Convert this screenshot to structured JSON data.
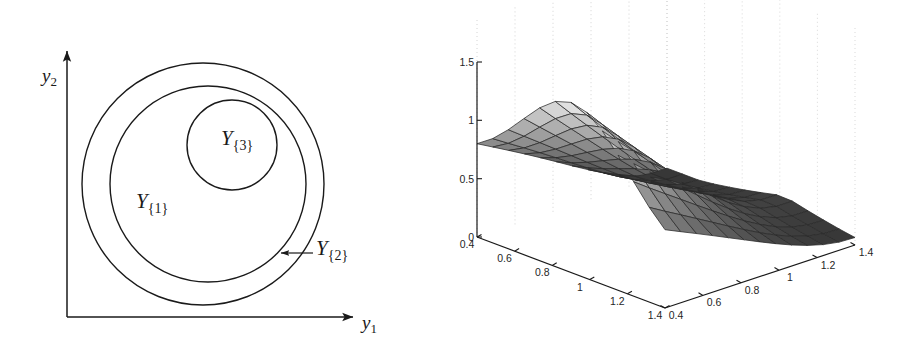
{
  "figure": {
    "panels": [
      {
        "id": "set-diagram",
        "kind": "diagram",
        "axes": {
          "x_label": "y",
          "x_label_sub": "1",
          "y_label": "y",
          "y_label_sub": "2",
          "origin_px": [
            67,
            317
          ],
          "x_axis_end_px": [
            357,
            317
          ],
          "y_axis_end_px": [
            67,
            47
          ],
          "arrow_heads": true
        },
        "regions": [
          {
            "name": "Y1",
            "label": "Y",
            "label_sub": "{1}",
            "shape": "circle",
            "center_px": [
              208,
              184
            ],
            "radius_px": 98,
            "label_px": [
              143,
              202
            ],
            "fill": "none",
            "stroke": "#1a1a1a"
          },
          {
            "name": "Y2",
            "label": "Y",
            "label_sub": "{2}",
            "shape": "circle",
            "center_px": [
              203,
              184
            ],
            "radius_px": 121,
            "label_px": [
              318,
              248
            ],
            "fill": "none",
            "stroke": "#1a1a1a",
            "leader_arrow": {
              "from_px": [
                312,
                253
              ],
              "to_px": [
                282,
                253
              ]
            }
          },
          {
            "name": "Y3",
            "label": "Y",
            "label_sub": "{3}",
            "shape": "circle",
            "center_px": [
              232,
              145
            ],
            "radius_px": 45,
            "label_px": [
              228,
              140
            ],
            "fill": "none",
            "stroke": "#1a1a1a"
          }
        ]
      },
      {
        "id": "surface-plot",
        "kind": "surface3d"
      }
    ]
  },
  "chart_data": {
    "type": "surface",
    "title": "",
    "xlabel": "",
    "ylabel": "",
    "zlabel": "",
    "grid": true,
    "grid_style": "dotted-vertical",
    "legend": "none",
    "colormap": "gray",
    "view": {
      "projection": "axonometric",
      "front_corner_px": [
        665,
        308
      ],
      "left_corner_px": [
        477,
        237
      ],
      "right_corner_px": [
        855,
        245
      ],
      "z_top_px": [
        477,
        62
      ]
    },
    "axes": {
      "x": {
        "label": "",
        "ticks": [
          0.4,
          0.6,
          0.8,
          1,
          1.2,
          1.4
        ],
        "tick_labels": [
          "0.4",
          "0.6",
          "0.8",
          "1",
          "1.2",
          "1.4"
        ],
        "lim": [
          0.4,
          1.4
        ],
        "direction": "left-back-to-front",
        "note": "runs from upper-left corner down-right to front corner"
      },
      "y": {
        "label": "",
        "ticks": [
          0.4,
          0.6,
          0.8,
          1,
          1.2,
          1.4
        ],
        "tick_labels": [
          "0.4",
          "0.6",
          "0.8",
          "1",
          "1.2",
          "1.4"
        ],
        "lim": [
          0.4,
          1.4
        ],
        "direction": "front-to-right-back",
        "note": "runs from front corner up-right to right corner"
      },
      "z": {
        "label": "",
        "ticks": [
          0,
          0.5,
          1,
          1.5
        ],
        "tick_labels": [
          "0",
          "0.5",
          "1",
          "1.5"
        ],
        "lim": [
          0,
          1.5
        ],
        "direction": "vertical-left-edge"
      }
    },
    "mesh": {
      "nx": 13,
      "ny": 13
    },
    "surface_description": "Smooth single-humped surface, ridge rising from z~0.63 at the back-left edge to a crest near z~1.45, then falling steeply toward the right-front corner where it plunges to z~0.05; a saddle/fold is visible at the lower-front where the sheet bottoms near z~0.35.",
    "z_samples": {
      "back_left_edge": 0.63,
      "crest": 1.45,
      "front_fold": 0.35,
      "right_front_min": 0.05
    }
  }
}
